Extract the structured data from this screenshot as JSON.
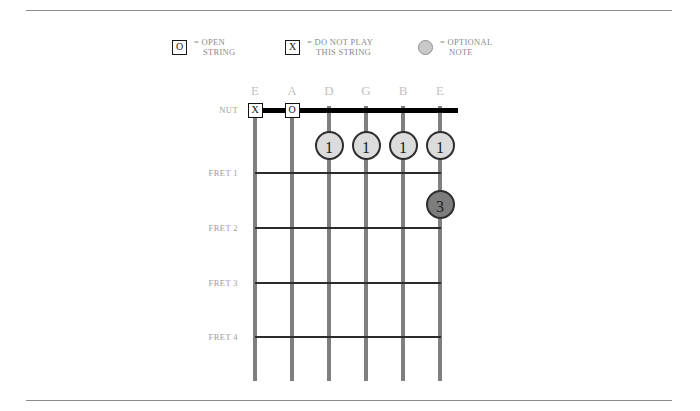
{
  "legend": {
    "items": [
      {
        "symbol": "O",
        "symbol_type": "boxed-letter",
        "line1": "= OPEN",
        "line2": "STRING"
      },
      {
        "symbol": "X",
        "symbol_type": "boxed-letter",
        "line1": "= DO NOT PLAY",
        "line2": "THIS STRING"
      },
      {
        "symbol": "",
        "symbol_type": "gray-circle",
        "line1": "= OPTIONAL",
        "line2": "NOTE"
      }
    ]
  },
  "chord_diagram": {
    "string_labels": [
      "E",
      "A",
      "D",
      "G",
      "B",
      "E"
    ],
    "fret_labels": [
      "NUT",
      "FRET 1",
      "FRET 2",
      "FRET 3",
      "FRET 4"
    ],
    "nut_markers": [
      {
        "string": 1,
        "symbol": "X"
      },
      {
        "string": 2,
        "symbol": "O"
      }
    ],
    "finger_dots": [
      {
        "string": 3,
        "fret": 1,
        "finger": "1",
        "style": "light"
      },
      {
        "string": 4,
        "fret": 1,
        "finger": "1",
        "style": "light"
      },
      {
        "string": 5,
        "fret": 1,
        "finger": "1",
        "style": "light"
      },
      {
        "string": 6,
        "fret": 1,
        "finger": "1",
        "style": "light"
      },
      {
        "string": 6,
        "fret": 2,
        "finger": "3",
        "style": "dark"
      }
    ],
    "colors": {
      "string": "#7f7f7f",
      "fret_line": "#2b2b2b",
      "nut": "#000000",
      "dot_light_fill": "#dcdcdc",
      "dot_dark_fill": "#7d7d7d",
      "dot_border": "#2e2e2e",
      "string_label": "#c2c2c2",
      "fret_label": "#9d9d9d",
      "legend_text": "#8a8a8a",
      "rule": "#8c8c8c"
    }
  }
}
